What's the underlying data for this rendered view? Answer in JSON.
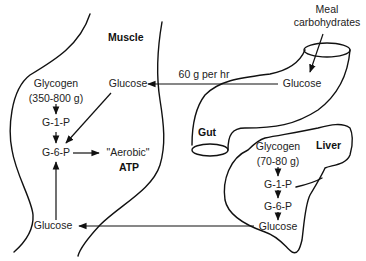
{
  "diagram": {
    "colors": {
      "stroke": "#111111",
      "text": "#222222",
      "background": "#ffffff"
    },
    "organs": {
      "muscle": {
        "label": "Muscle",
        "glycogen": "Glycogen",
        "glycogen_amount": "(350-800 g)",
        "g1p": "G-1-P",
        "g6p": "G-6-P",
        "glucose_top": "Glucose",
        "glucose_bottom": "Glucose",
        "aerobic": "\"Aerobic\"",
        "atp": "ATP"
      },
      "gut": {
        "label": "Gut",
        "input": "Meal\ncarbohydrates",
        "input_line1": "Meal",
        "input_line2": "carbohydrates",
        "glucose": "Glucose",
        "flow_rate": "60 g per hr"
      },
      "liver": {
        "label": "Liver",
        "glycogen": "Glycogen",
        "glycogen_amount": "(70-80 g)",
        "g1p": "G-1-P",
        "g6p": "G-6-P",
        "glucose": "Glucose"
      }
    },
    "flows": [
      {
        "from": "Meal carbohydrates",
        "to": "Gut Glucose"
      },
      {
        "from": "Gut Glucose",
        "to": "Muscle Glucose (top)",
        "label": "60 g per hr"
      },
      {
        "from": "Muscle Glucose (top)",
        "to": "Muscle G-6-P"
      },
      {
        "from": "Muscle Glycogen",
        "to": "Muscle G-1-P"
      },
      {
        "from": "Muscle G-1-P",
        "to": "Muscle G-6-P"
      },
      {
        "from": "Muscle Glucose (bottom)",
        "to": "Muscle G-6-P"
      },
      {
        "from": "Muscle G-6-P",
        "to": "\"Aerobic\" ATP"
      },
      {
        "from": "Liver Glycogen",
        "to": "Liver G-1-P"
      },
      {
        "from": "Liver G-1-P",
        "to": "Liver G-6-P"
      },
      {
        "from": "Liver G-6-P",
        "to": "Liver Glucose"
      },
      {
        "from": "Liver Glucose",
        "to": "Muscle Glucose (bottom)"
      }
    ]
  }
}
